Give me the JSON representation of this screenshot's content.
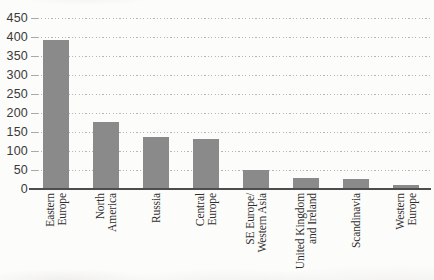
{
  "chart_data": {
    "type": "bar",
    "title": "",
    "xlabel": "",
    "ylabel": "",
    "categories": [
      "Eastern Europe",
      "North America",
      "Russia",
      "Central Europe",
      "SE Europe/Western Asia",
      "United Kingdom and Ireland",
      "Scandinavia",
      "Western Europe"
    ],
    "category_display_lines": [
      [
        "Eastern",
        "Europe"
      ],
      [
        "North",
        "America"
      ],
      [
        "Russia"
      ],
      [
        "Central",
        "Europe"
      ],
      [
        "SE Europe/",
        "Western Asia"
      ],
      [
        "United Kingdom",
        "and Ireland"
      ],
      [
        "Scandinavia"
      ],
      [
        "Western",
        "Europe"
      ]
    ],
    "values": [
      390,
      175,
      134,
      130,
      47,
      27,
      23,
      9
    ],
    "ylim": [
      0,
      450
    ],
    "yticks": [
      0,
      50,
      100,
      150,
      200,
      250,
      300,
      350,
      400,
      450
    ],
    "grid": "horizontal-dotted",
    "legend": "none",
    "colors": {
      "bar": "#8a8a8a",
      "axis_line": "#4d4d4d",
      "gridline": "#b5b5b5",
      "y_tick_label": "#3a3a3a",
      "category_label": "#2f2f2f",
      "background": "#fcfcfa"
    }
  }
}
